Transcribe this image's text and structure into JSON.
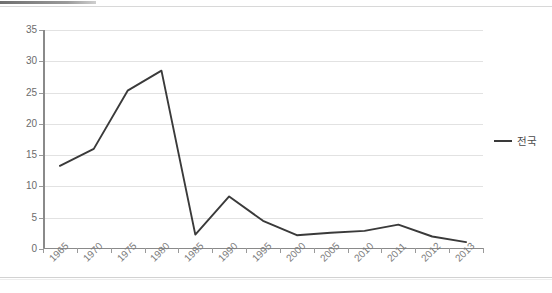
{
  "chart_data": {
    "type": "line",
    "title": "",
    "subtitle": "",
    "xlabel": "",
    "ylabel": "",
    "categories": [
      "1965",
      "1970",
      "1975",
      "1980",
      "1985",
      "1990",
      "1995",
      "2000",
      "2005",
      "2010",
      "2011",
      "2012",
      "2013"
    ],
    "series": [
      {
        "name": "전국",
        "color": "#3a3a3a",
        "values": [
          13.3,
          16.0,
          25.3,
          28.5,
          2.3,
          8.4,
          4.5,
          2.2,
          2.6,
          2.9,
          3.9,
          2.0,
          1.1
        ]
      }
    ],
    "ylim": [
      0,
      35
    ],
    "ytick_step": 5,
    "yticks": [
      "35",
      "30",
      "25",
      "20",
      "15",
      "10",
      "5",
      "0"
    ],
    "grid": true,
    "grid_color": "#e2e2e2",
    "legend_position": "right",
    "axis_color": "#8a8a8a",
    "tick_label_color": "#6b6b6b",
    "x_label_rotation_deg": -45
  },
  "legend": {
    "entries": [
      {
        "label": "전국",
        "color": "#3a3a3a"
      }
    ]
  }
}
